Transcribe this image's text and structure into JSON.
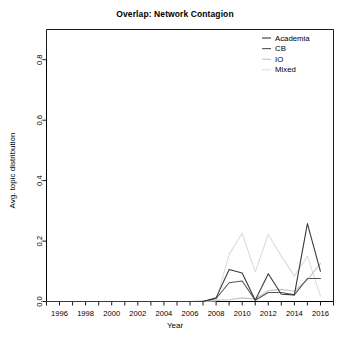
{
  "chart_data": {
    "type": "line",
    "title": "Overlap: Network Contagion",
    "xlabel": "Year",
    "ylabel": "Avg. topic distribution",
    "xlim": [
      1995,
      2017
    ],
    "ylim": [
      0.0,
      0.9
    ],
    "grid": false,
    "legend_position": "top-right",
    "xticks": [
      1996,
      1998,
      2000,
      2002,
      2004,
      2006,
      2008,
      2010,
      2012,
      2014,
      2016
    ],
    "xtick_labels": [
      "1996",
      "1998",
      "2000",
      "2002",
      "2004",
      "2006",
      "2008",
      "2010",
      "2012",
      "2014",
      "2016"
    ],
    "xminorticks": [
      1995,
      1997,
      1999,
      2001,
      2003,
      2005,
      2007,
      2009,
      2011,
      2013,
      2015,
      2017
    ],
    "yticks": [
      0.0,
      0.2,
      0.4,
      0.6,
      0.8
    ],
    "ytick_labels": [
      "0.0",
      "0.2",
      "0.4",
      "0.6",
      "0.8"
    ],
    "x": [
      1995,
      1996,
      1997,
      1998,
      1999,
      2000,
      2001,
      2002,
      2003,
      2004,
      2005,
      2006,
      2007,
      2008,
      2009,
      2010,
      2011,
      2012,
      2013,
      2014,
      2015,
      2016
    ],
    "series": [
      {
        "name": "Academia",
        "color": "#3a3a3a",
        "values": [
          0.0,
          0.0,
          0.0,
          0.0,
          0.0,
          0.0,
          0.0,
          0.0,
          0.0,
          0.0,
          0.0,
          0.0,
          0.0,
          0.012,
          0.106,
          0.094,
          0.004,
          0.092,
          0.024,
          0.022,
          0.258,
          0.1
        ]
      },
      {
        "name": "CB",
        "color": "#555555",
        "values": [
          0.0,
          0.0,
          0.0,
          0.0,
          0.0,
          0.0,
          0.0,
          0.0,
          0.0,
          0.0,
          0.0,
          0.0,
          0.0,
          0.01,
          0.062,
          0.068,
          0.004,
          0.03,
          0.03,
          0.022,
          0.076,
          0.076
        ]
      },
      {
        "name": "IO",
        "color": "#c2c2c2",
        "values": [
          0.0,
          0.0,
          0.0,
          0.0,
          0.0,
          0.0,
          0.0,
          0.0,
          0.0,
          0.0,
          0.0,
          0.0,
          0.002,
          0.004,
          0.006,
          0.012,
          0.008,
          0.036,
          0.04,
          0.034,
          0.072,
          0.126
        ]
      },
      {
        "name": "Mixed",
        "color": "#dcdcdc",
        "values": [
          0.0,
          0.0,
          0.0,
          0.0,
          0.0,
          0.0,
          0.0,
          0.0,
          0.0,
          0.0,
          0.0,
          0.0,
          0.0,
          0.002,
          0.156,
          0.226,
          0.098,
          0.222,
          0.15,
          0.084,
          0.15,
          0.018
        ]
      }
    ]
  },
  "legend": {
    "items": [
      {
        "label": "Academia",
        "color": "#3a3a3a"
      },
      {
        "label": "CB",
        "color": "#555555"
      },
      {
        "label": "IO",
        "color": "#c2c2c2"
      },
      {
        "label": "Mixed",
        "color": "#dcdcdc"
      }
    ]
  }
}
